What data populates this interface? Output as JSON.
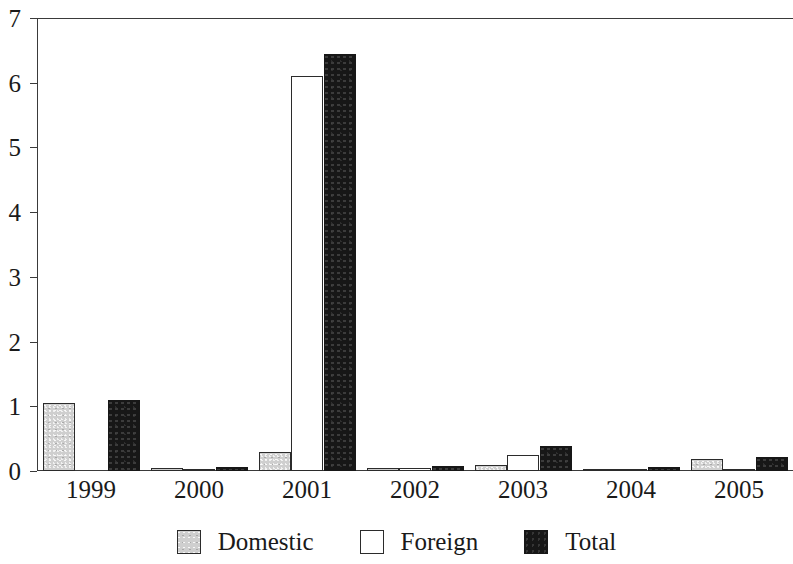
{
  "chart_data": {
    "type": "bar",
    "title": "",
    "subtitle": "",
    "xlabel": "",
    "ylabel": "",
    "categories": [
      "1999",
      "2000",
      "2001",
      "2002",
      "2003",
      "2004",
      "2005"
    ],
    "series": [
      {
        "name": "Domestic",
        "color": "#cfcfcf",
        "values": [
          1.05,
          0.04,
          0.3,
          0.04,
          0.1,
          0.03,
          0.18
        ]
      },
      {
        "name": "Foreign",
        "color": "#ffffff",
        "values": [
          0.0,
          0.02,
          6.1,
          0.05,
          0.25,
          0.02,
          0.01
        ]
      },
      {
        "name": "Total",
        "color": "#171717",
        "values": [
          1.1,
          0.06,
          6.45,
          0.08,
          0.38,
          0.06,
          0.22
        ]
      }
    ],
    "ylim": [
      0,
      7
    ],
    "yticks": [
      0,
      1,
      2,
      3,
      4,
      5,
      6,
      7
    ],
    "ytick_labels": [
      "0",
      "1",
      "2",
      "3",
      "4",
      "5",
      "6",
      "7"
    ],
    "grid": false,
    "legend_position": "bottom",
    "legend_entries": [
      "Domestic",
      "Foreign",
      "Total"
    ]
  },
  "axis": {
    "y_ticks": [
      "0",
      "1",
      "2",
      "3",
      "4",
      "5",
      "6",
      "7"
    ],
    "x_ticks": [
      "1999",
      "2000",
      "2001",
      "2002",
      "2003",
      "2004",
      "2005"
    ]
  },
  "legend": {
    "items": [
      {
        "label": "Domestic",
        "swatch": "domestic"
      },
      {
        "label": "Foreign",
        "swatch": "foreign"
      },
      {
        "label": "Total",
        "swatch": "total"
      }
    ]
  }
}
